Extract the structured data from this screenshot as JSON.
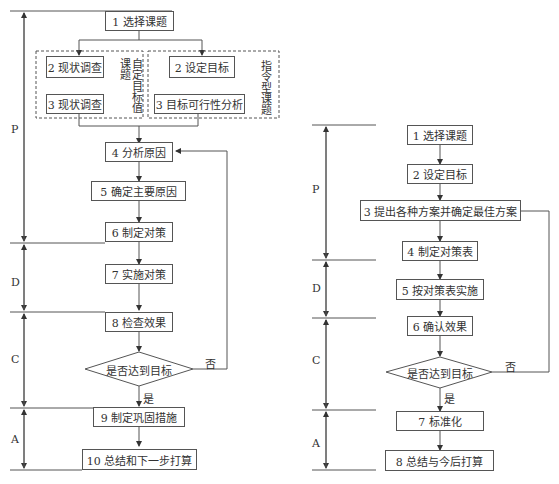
{
  "left_flow": {
    "phases": [
      "P",
      "D",
      "C",
      "A"
    ],
    "steps": {
      "s1": "1 选择课题",
      "s2a": "2 现状调查",
      "s3a": "3 现状调查",
      "s2b": "2 设定目标",
      "s3b": "3 目标可行性分析",
      "s4": "4 分析原因",
      "s5": "5 确定主要原因",
      "s6": "6 制定对策",
      "s7": "7 实施对策",
      "s8": "8 检查效果",
      "s9": "9 制定巩固措施",
      "s10": "10 总结和下一步打算"
    },
    "group_left_label_col1": "课题",
    "group_left_label_col2": "自定目标值",
    "group_right_label": "指令型课题",
    "decision": "是否达到目标",
    "yes": "是",
    "no": "否"
  },
  "right_flow": {
    "phases": [
      "P",
      "D",
      "C",
      "A"
    ],
    "steps": {
      "s1": "1 选择课题",
      "s2": "2 设定目标",
      "s3": "3 提出各种方案并确定最佳方案",
      "s4": "4 制定对策表",
      "s5": "5 按对策表实施",
      "s6": "6 确认效果",
      "s7": "7 标准化",
      "s8": "8 总结与今后打算"
    },
    "decision": "是否达到目标",
    "yes": "是",
    "no": "否"
  }
}
